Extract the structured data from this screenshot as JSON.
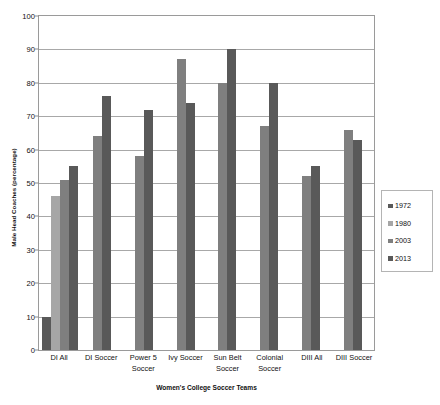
{
  "chart_data": {
    "type": "bar",
    "title": "",
    "xlabel": "Women's College Soccer Teams",
    "ylabel": "Male Head Coaches (percentage)",
    "ylim": [
      0,
      100
    ],
    "ytick_step": 10,
    "yticks": [
      0,
      10,
      20,
      30,
      40,
      50,
      60,
      70,
      80,
      90,
      100
    ],
    "grid": true,
    "legend_position": "right",
    "categories": [
      "DI All",
      "DI Soccer",
      "Power 5 Soccer",
      "Ivy Soccer",
      "Sun Belt Soccer",
      "Colonial Soccer",
      "DIII All",
      "DIII Soccer"
    ],
    "category_lines": [
      [
        "DI All"
      ],
      [
        "DI Soccer"
      ],
      [
        "Power 5",
        "Soccer"
      ],
      [
        "Ivy Soccer"
      ],
      [
        "Sun Belt",
        "Soccer"
      ],
      [
        "Colonial",
        "Soccer"
      ],
      [
        "DIII All"
      ],
      [
        "DIII Soccer"
      ]
    ],
    "series": [
      {
        "name": "1972",
        "color": "#595959",
        "values": [
          10,
          null,
          null,
          null,
          null,
          null,
          null,
          null
        ]
      },
      {
        "name": "1980",
        "color": "#a6a6a6",
        "values": [
          46,
          null,
          null,
          null,
          null,
          null,
          null,
          null
        ]
      },
      {
        "name": "2003",
        "color": "#7f7f7f",
        "values": [
          51,
          64,
          58,
          87,
          80,
          67,
          52,
          66
        ]
      },
      {
        "name": "2013",
        "color": "#595959",
        "values": [
          55,
          76,
          72,
          74,
          90,
          80,
          55,
          63
        ]
      }
    ]
  },
  "legend": {
    "items": [
      {
        "label": "1972",
        "color": "#595959"
      },
      {
        "label": "1980",
        "color": "#a6a6a6"
      },
      {
        "label": "2003",
        "color": "#7f7f7f"
      },
      {
        "label": "2013",
        "color": "#595959"
      }
    ]
  },
  "colors": {
    "plot_border": "#9a9a9a",
    "gridline": "#a8a8a8",
    "text": "#111111",
    "background": "#ffffff"
  }
}
